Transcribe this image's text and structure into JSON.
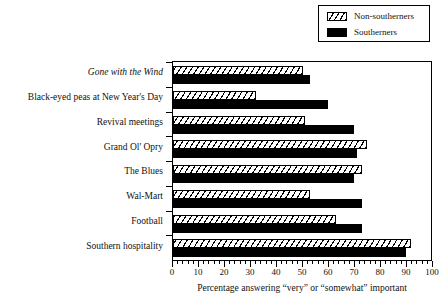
{
  "chart_data": {
    "type": "bar",
    "orientation": "horizontal",
    "title": "",
    "subtitle": "",
    "xlabel": "Percentage answering “very” or “somewhat” important",
    "ylabel": "",
    "xlim": [
      0,
      100
    ],
    "xticks": [
      0,
      10,
      20,
      30,
      40,
      50,
      60,
      70,
      80,
      90,
      100
    ],
    "xtick_labels": [
      "0",
      "10",
      "20",
      "30",
      "40",
      "50",
      "60",
      "70",
      "80",
      "90",
      "100"
    ],
    "minor_tick_step": 2,
    "grid": false,
    "legend_position": "top-right",
    "categories": [
      "Gone with the Wind",
      "Black-eyed peas at New Year's Day",
      "Revival meetings",
      "Grand Ol' Opry",
      "The Blues",
      "Wal-Mart",
      "Football",
      "Southern hospitality"
    ],
    "category_styles": [
      "italic",
      "normal",
      "normal",
      "normal",
      "normal",
      "normal",
      "normal",
      "normal"
    ],
    "series": [
      {
        "name": "Non-southerners",
        "fill": "hatched",
        "color": "#ffffff",
        "edge_color": "#000000",
        "values": [
          50,
          32,
          51,
          75,
          73,
          53,
          63,
          92
        ]
      },
      {
        "name": "Southerners",
        "fill": "solid",
        "color": "#000000",
        "edge_color": "#000000",
        "values": [
          53,
          60,
          70,
          71,
          70,
          73,
          73,
          90
        ]
      }
    ]
  },
  "legend": {
    "items": [
      {
        "label": "Non-southerners",
        "swatch": "hatched"
      },
      {
        "label": "Southerners",
        "swatch": "solid"
      }
    ]
  }
}
